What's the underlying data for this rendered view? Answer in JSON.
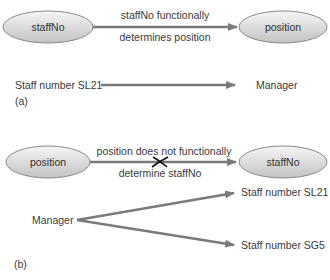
{
  "colors": {
    "arrow": "#7a7a7a",
    "ellipse_fill_light": "#f4f4f4",
    "ellipse_fill_dark": "#c4c4c4",
    "ellipse_stroke": "#8a8a8a",
    "cross": "#111111",
    "text": "#3a3a3a"
  },
  "part_a": {
    "node_left": "staffNo",
    "node_right": "position",
    "edge_label_line1": "staffNo functionally",
    "edge_label_line2": "determines position",
    "example_left": "Staff number SL21",
    "example_right": "Manager",
    "caption": "(a)"
  },
  "part_b": {
    "node_left": "position",
    "node_right": "staffNo",
    "edge_label_line1": "position does not functionally",
    "edge_label_line2": "determine staffNo",
    "example_source": "Manager",
    "example_targets": [
      "Staff number SL21",
      "Staff number SG5"
    ],
    "caption": "(b)"
  }
}
